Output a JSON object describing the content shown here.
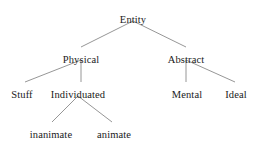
{
  "diagram": {
    "type": "tree",
    "background_color": "#ffffff",
    "edge_color": "#8a8a8a",
    "text_color": "#1a1a1a",
    "nodes": [
      {
        "id": "entity",
        "label": "Entity",
        "level": 0,
        "x": 133,
        "y": 14
      },
      {
        "id": "physical",
        "label": "Physical",
        "level": 1,
        "x": 81,
        "y": 54
      },
      {
        "id": "abstract",
        "label": "Abstract",
        "level": 1,
        "x": 186,
        "y": 54
      },
      {
        "id": "stuff",
        "label": "Stuff",
        "level": 2,
        "x": 22,
        "y": 89
      },
      {
        "id": "individuated",
        "label": "Individuated",
        "level": 2,
        "x": 78,
        "y": 89
      },
      {
        "id": "mental",
        "label": "Mental",
        "level": 2,
        "x": 187,
        "y": 89
      },
      {
        "id": "ideal",
        "label": "Ideal",
        "level": 2,
        "x": 236,
        "y": 89
      },
      {
        "id": "inanimate",
        "label": "inanimate",
        "level": 3,
        "x": 51,
        "y": 129
      },
      {
        "id": "animate",
        "label": "animate",
        "level": 3,
        "x": 114,
        "y": 129
      }
    ],
    "edges": [
      {
        "from": "entity",
        "to": "physical",
        "x1": 133,
        "y1": 21,
        "x2": 81,
        "y2": 47
      },
      {
        "from": "entity",
        "to": "abstract",
        "x1": 133,
        "y1": 21,
        "x2": 186,
        "y2": 47
      },
      {
        "from": "physical",
        "to": "stuff",
        "x1": 81,
        "y1": 60,
        "x2": 25,
        "y2": 82
      },
      {
        "from": "physical",
        "to": "individuated",
        "x1": 81,
        "y1": 60,
        "x2": 81,
        "y2": 82
      },
      {
        "from": "abstract",
        "to": "mental",
        "x1": 186,
        "y1": 60,
        "x2": 186,
        "y2": 82
      },
      {
        "from": "abstract",
        "to": "ideal",
        "x1": 186,
        "y1": 60,
        "x2": 235,
        "y2": 82
      },
      {
        "from": "individuated",
        "to": "inanimate",
        "x1": 78,
        "y1": 96,
        "x2": 52,
        "y2": 122
      },
      {
        "from": "individuated",
        "to": "animate",
        "x1": 78,
        "y1": 96,
        "x2": 112,
        "y2": 122
      }
    ]
  }
}
